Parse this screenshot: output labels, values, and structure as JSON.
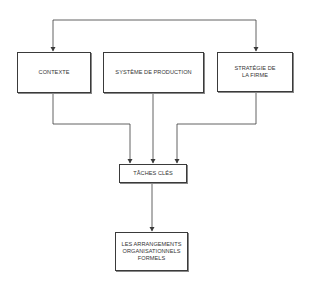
{
  "diagram": {
    "nodes": [
      {
        "id": "contexte",
        "label": "CONTEXTE"
      },
      {
        "id": "systeme",
        "label": "SYSTÈME DE PRODUCTION"
      },
      {
        "id": "strategie",
        "label_line1": "STRATÉGIE DE",
        "label_line2": "LA FIRME"
      },
      {
        "id": "taches",
        "label": "TÂCHES CLÉS"
      },
      {
        "id": "arrangements",
        "label_line1": "LES ARRANGEMENTS",
        "label_line2": "ORGANISATIONNELS",
        "label_line3": "FORMELS"
      }
    ],
    "edges": [
      {
        "from": "contexte",
        "to": "strategie",
        "bidirectional": true
      },
      {
        "from": "contexte",
        "to": "taches"
      },
      {
        "from": "systeme",
        "to": "taches"
      },
      {
        "from": "strategie",
        "to": "taches"
      },
      {
        "from": "taches",
        "to": "arrangements"
      }
    ],
    "colors": {
      "line": "#3a3a3a",
      "box_border": "#3a3a3a",
      "text": "#333333",
      "background": "#ffffff"
    }
  }
}
